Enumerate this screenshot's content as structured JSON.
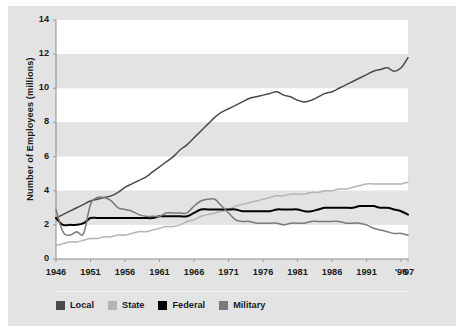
{
  "figure": {
    "background_color": "#e3e3e3",
    "plot_band_light": "#ffffff",
    "plot_band_dark": "#e3e3e3"
  },
  "chart_data": {
    "type": "line",
    "title": "",
    "xlabel": "",
    "ylabel": "Number of Employees (millions)",
    "ylim": [
      0,
      14
    ],
    "xlim": [
      1946,
      1997
    ],
    "yticks": [
      0,
      2,
      4,
      6,
      8,
      10,
      12,
      14
    ],
    "ytick_labels": [
      "0",
      "2",
      "4",
      "6",
      "8",
      "10",
      "12",
      "14"
    ],
    "xticks": [
      1946,
      1951,
      1956,
      1961,
      1966,
      1971,
      1976,
      1981,
      1986,
      1991,
      1996,
      1997
    ],
    "xtick_labels": [
      "1946",
      "1951",
      "1956",
      "1961",
      "1966",
      "1971",
      "1976",
      "1981",
      "1986",
      "1991",
      "'96",
      "'97"
    ],
    "grid": false,
    "banded_background": true,
    "legend_position": "bottom-left",
    "x": [
      1946,
      1947,
      1948,
      1949,
      1950,
      1951,
      1952,
      1953,
      1954,
      1955,
      1956,
      1957,
      1958,
      1959,
      1960,
      1961,
      1962,
      1963,
      1964,
      1965,
      1966,
      1967,
      1968,
      1969,
      1970,
      1971,
      1972,
      1973,
      1974,
      1975,
      1976,
      1977,
      1978,
      1979,
      1980,
      1981,
      1982,
      1983,
      1984,
      1985,
      1986,
      1987,
      1988,
      1989,
      1990,
      1991,
      1992,
      1993,
      1994,
      1995,
      1996,
      1997
    ],
    "series": [
      {
        "name": "Local",
        "color": "#4a4a4a",
        "values": [
          2.4,
          2.6,
          2.8,
          3.0,
          3.2,
          3.4,
          3.5,
          3.6,
          3.7,
          3.9,
          4.2,
          4.4,
          4.6,
          4.8,
          5.1,
          5.4,
          5.7,
          6.0,
          6.4,
          6.7,
          7.1,
          7.5,
          7.9,
          8.3,
          8.6,
          8.8,
          9.0,
          9.2,
          9.4,
          9.5,
          9.6,
          9.7,
          9.8,
          9.6,
          9.5,
          9.3,
          9.2,
          9.3,
          9.5,
          9.7,
          9.8,
          10.0,
          10.2,
          10.4,
          10.6,
          10.8,
          11.0,
          11.1,
          11.2,
          11.0,
          11.2,
          11.8
        ]
      },
      {
        "name": "State",
        "color": "#b4b4b4",
        "values": [
          0.8,
          0.9,
          1.0,
          1.0,
          1.1,
          1.2,
          1.2,
          1.3,
          1.3,
          1.4,
          1.4,
          1.5,
          1.6,
          1.6,
          1.7,
          1.8,
          1.9,
          1.9,
          2.0,
          2.2,
          2.3,
          2.5,
          2.6,
          2.7,
          2.8,
          2.9,
          3.1,
          3.2,
          3.3,
          3.4,
          3.5,
          3.6,
          3.7,
          3.7,
          3.8,
          3.8,
          3.8,
          3.9,
          3.9,
          4.0,
          4.0,
          4.1,
          4.1,
          4.2,
          4.3,
          4.4,
          4.4,
          4.4,
          4.4,
          4.4,
          4.4,
          4.5
        ]
      },
      {
        "name": "Federal",
        "color": "#000000",
        "values": [
          2.4,
          2.0,
          2.0,
          2.0,
          2.1,
          2.4,
          2.4,
          2.4,
          2.4,
          2.4,
          2.4,
          2.4,
          2.4,
          2.4,
          2.4,
          2.5,
          2.5,
          2.5,
          2.5,
          2.5,
          2.7,
          2.9,
          2.9,
          2.9,
          2.9,
          2.9,
          2.9,
          2.8,
          2.8,
          2.8,
          2.8,
          2.8,
          2.9,
          2.9,
          2.9,
          2.9,
          2.8,
          2.8,
          2.9,
          3.0,
          3.0,
          3.0,
          3.0,
          3.0,
          3.1,
          3.1,
          3.1,
          3.0,
          3.0,
          2.9,
          2.8,
          2.6
        ]
      },
      {
        "name": "Military",
        "color": "#7a7a7a",
        "values": [
          2.9,
          1.6,
          1.4,
          1.6,
          1.5,
          3.2,
          3.6,
          3.6,
          3.4,
          3.0,
          2.9,
          2.8,
          2.6,
          2.5,
          2.5,
          2.5,
          2.7,
          2.7,
          2.7,
          2.7,
          3.1,
          3.4,
          3.5,
          3.5,
          3.1,
          2.7,
          2.3,
          2.2,
          2.2,
          2.1,
          2.1,
          2.1,
          2.1,
          2.0,
          2.1,
          2.1,
          2.1,
          2.2,
          2.2,
          2.2,
          2.2,
          2.2,
          2.1,
          2.1,
          2.1,
          2.0,
          1.8,
          1.7,
          1.6,
          1.5,
          1.5,
          1.4
        ]
      }
    ],
    "series_notes": [
      "Military dips sharply after 1946 demobilization, peaks again during Korea (1952) and Vietnam (1968).",
      "Local government employment rises steadily from 2.4 to about 11.8 million.",
      "Federal employment stays nearly flat between 2.0 and 3.1 million."
    ]
  },
  "legend": {
    "items": [
      {
        "label": "Local",
        "color": "#4a4a4a"
      },
      {
        "label": "State",
        "color": "#b4b4b4"
      },
      {
        "label": "Federal",
        "color": "#000000"
      },
      {
        "label": "Military",
        "color": "#7a7a7a"
      }
    ]
  }
}
